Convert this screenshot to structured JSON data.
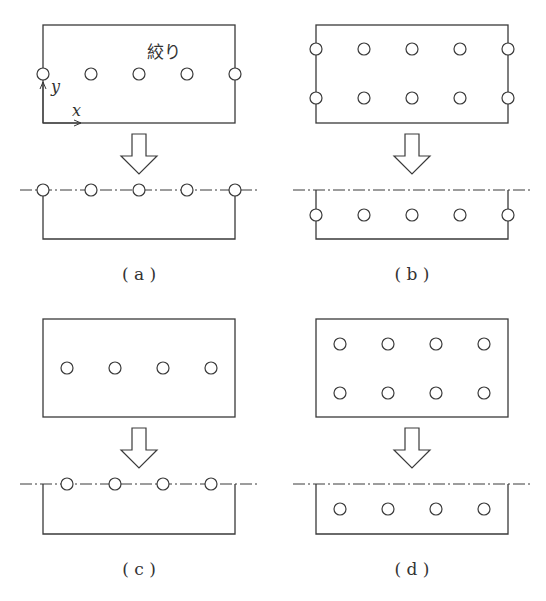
{
  "figure": {
    "stroke_color": "#3a3a3a",
    "panels": [
      {
        "id": "a",
        "caption": "( a )",
        "top_label": "絞り",
        "axis_x_label": "x",
        "axis_y_label": "y",
        "top_rect": {
          "x": 43,
          "y": 25,
          "w": 192,
          "h": 98
        },
        "top_holes": [
          [
            43,
            74
          ],
          [
            91,
            74
          ],
          [
            139,
            74
          ],
          [
            187,
            74
          ],
          [
            235,
            74
          ]
        ],
        "arrow_center_x": 139,
        "dash_line_y": 190,
        "bottom_rect": {
          "x": 43,
          "y": 190,
          "w": 192,
          "h": 49
        },
        "bottom_holes": [
          [
            43,
            190
          ],
          [
            91,
            190
          ],
          [
            139,
            190
          ],
          [
            187,
            190
          ],
          [
            235,
            190
          ]
        ],
        "description": "Holes on rect edge at mid-height; folded at hole line"
      },
      {
        "id": "b",
        "caption": "( b )",
        "top_rect": {
          "x": 316,
          "y": 25,
          "w": 192,
          "h": 98
        },
        "top_holes": [
          [
            316,
            49
          ],
          [
            364,
            49
          ],
          [
            412,
            49
          ],
          [
            460,
            49
          ],
          [
            508,
            49
          ],
          [
            316,
            98
          ],
          [
            364,
            98
          ],
          [
            412,
            98
          ],
          [
            460,
            98
          ],
          [
            508,
            98
          ]
        ],
        "arrow_center_x": 412,
        "dash_line_y": 190,
        "bottom_rect": {
          "x": 316,
          "y": 190,
          "w": 192,
          "h": 49
        },
        "bottom_holes": [
          [
            316,
            215
          ],
          [
            364,
            215
          ],
          [
            412,
            215
          ],
          [
            460,
            215
          ],
          [
            508,
            215
          ]
        ],
        "description": "Two rows of holes including edge holes; folded at center"
      },
      {
        "id": "c",
        "caption": "( c )",
        "top_rect": {
          "x": 43,
          "y": 319,
          "w": 192,
          "h": 98
        },
        "top_holes": [
          [
            67,
            368
          ],
          [
            115,
            368
          ],
          [
            163,
            368
          ],
          [
            211,
            368
          ]
        ],
        "arrow_center_x": 139,
        "dash_line_y": 484,
        "bottom_rect": {
          "x": 43,
          "y": 484,
          "w": 192,
          "h": 50
        },
        "bottom_holes": [
          [
            67,
            484
          ],
          [
            115,
            484
          ],
          [
            163,
            484
          ],
          [
            211,
            484
          ]
        ],
        "description": "Single row of interior holes; folded at hole line"
      },
      {
        "id": "d",
        "caption": "( d )",
        "top_rect": {
          "x": 316,
          "y": 319,
          "w": 192,
          "h": 98
        },
        "top_holes": [
          [
            340,
            344
          ],
          [
            388,
            344
          ],
          [
            436,
            344
          ],
          [
            484,
            344
          ],
          [
            340,
            393
          ],
          [
            388,
            393
          ],
          [
            436,
            393
          ],
          [
            484,
            393
          ]
        ],
        "arrow_center_x": 412,
        "dash_line_y": 484,
        "bottom_rect": {
          "x": 316,
          "y": 484,
          "w": 192,
          "h": 50
        },
        "bottom_holes": [
          [
            340,
            509
          ],
          [
            388,
            509
          ],
          [
            436,
            509
          ],
          [
            484,
            509
          ]
        ],
        "description": "Two rows of interior holes; folded at center"
      }
    ]
  }
}
